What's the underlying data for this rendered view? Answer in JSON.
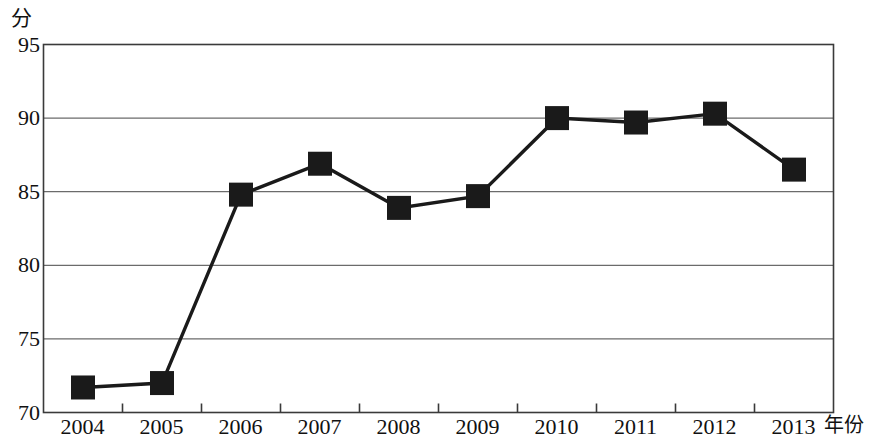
{
  "chart_data": {
    "type": "line",
    "title": "",
    "subtitle": "",
    "xlabel": "年份",
    "ylabel": "分",
    "categories": [
      "2004",
      "2005",
      "2006",
      "2007",
      "2008",
      "2009",
      "2010",
      "2011",
      "2012",
      "2013"
    ],
    "x": [
      2004,
      2005,
      2006,
      2007,
      2008,
      2009,
      2010,
      2011,
      2012,
      2013
    ],
    "values": [
      71.7,
      72.0,
      84.8,
      86.9,
      83.9,
      84.7,
      90.0,
      89.7,
      90.3,
      86.5
    ],
    "series": [
      {
        "name": "",
        "values": [
          71.7,
          72.0,
          84.8,
          86.9,
          83.9,
          84.7,
          90.0,
          89.7,
          90.3,
          86.5
        ]
      }
    ],
    "ylim": [
      70,
      95
    ],
    "xlim": [
      2004,
      2013
    ],
    "y_ticks": [
      70,
      75,
      80,
      85,
      90,
      95
    ],
    "y_tick_labels": [
      "70",
      "75",
      "80",
      "85",
      "90",
      "95"
    ],
    "x_ticks": [
      "2004",
      "2005",
      "2006",
      "2007",
      "2008",
      "2009",
      "2010",
      "2011",
      "2012",
      "2013"
    ],
    "grid": "horizontal",
    "legend": "none",
    "marker": "square",
    "line_color": "#1a1a1a",
    "marker_color": "#1a1a1a",
    "grid_color": "#6b6b6b",
    "axis_color": "#3a3a3a",
    "annotations": []
  },
  "axis": {
    "y_unit": "分",
    "x_unit": "年份"
  }
}
